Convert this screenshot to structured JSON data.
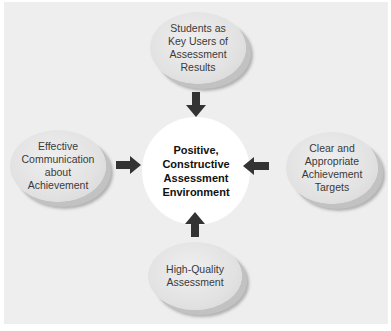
{
  "diagram": {
    "center": {
      "lines": [
        "Positive,",
        "Constructive",
        "Assessment",
        "Environment"
      ]
    },
    "nodes": {
      "top": {
        "lines": [
          "Students as",
          "Key Users of",
          "Assessment",
          "Results"
        ]
      },
      "left": {
        "lines": [
          "Effective",
          "Communication",
          "about",
          "Achievement"
        ]
      },
      "right": {
        "lines": [
          "Clear and",
          "Appropriate",
          "Achievement",
          "Targets"
        ]
      },
      "bottom": {
        "lines": [
          "High-Quality",
          "Assessment"
        ]
      }
    },
    "arrows": [
      "top-to-center",
      "left-to-center",
      "right-to-center",
      "bottom-to-center"
    ],
    "colors": {
      "background": "#eeeeee",
      "oval": "#e2e2e2",
      "center": "#ffffff",
      "arrow": "#333333"
    }
  }
}
